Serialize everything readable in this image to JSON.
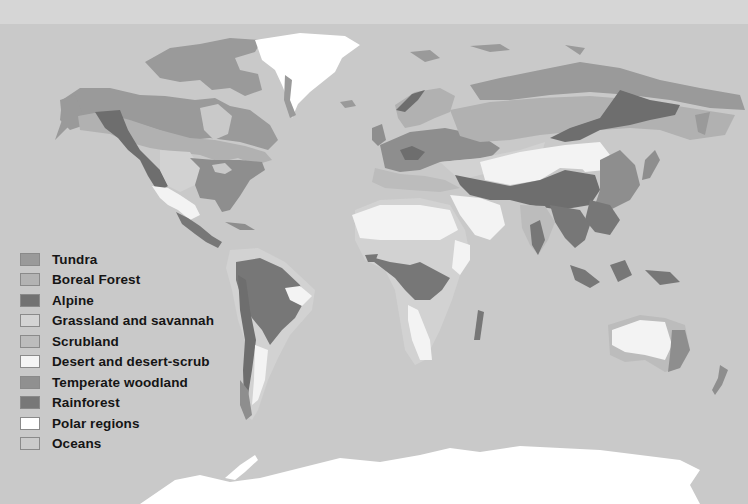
{
  "map": {
    "title": "World biomes",
    "colors": {
      "ocean": "#c9c9c9",
      "tundra": "#9a9a9a",
      "boreal": "#b1b1b1",
      "alpine": "#6e6e6e",
      "grassland": "#d2d2d2",
      "scrubland": "#bcbcbc",
      "desert": "#f3f3f3",
      "temperate": "#8e8e8e",
      "rainforest": "#777777",
      "polar": "#ffffff"
    }
  },
  "legend": {
    "items": [
      {
        "key": "tundra",
        "label": "Tundra",
        "color": "#9a9a9a"
      },
      {
        "key": "boreal",
        "label": "Boreal Forest",
        "color": "#b3b3b3"
      },
      {
        "key": "alpine",
        "label": "Alpine",
        "color": "#727272"
      },
      {
        "key": "grassland",
        "label": "Grassland and",
        "label_extra": "savannah",
        "color": "#d4d4d4"
      },
      {
        "key": "scrubland",
        "label": "Scrubland",
        "color": "#bcbcbc"
      },
      {
        "key": "desert",
        "label": "Desert and desert-scrub",
        "color": "#f4f4f4"
      },
      {
        "key": "temperate",
        "label": "Temperate woodland",
        "color": "#909090"
      },
      {
        "key": "rainforest",
        "label": "Rainforest",
        "color": "#787878"
      },
      {
        "key": "polar",
        "label": "Polar regions",
        "color": "#ffffff"
      },
      {
        "key": "oceans",
        "label": "Oceans",
        "color": "#cbcbcb"
      }
    ]
  }
}
